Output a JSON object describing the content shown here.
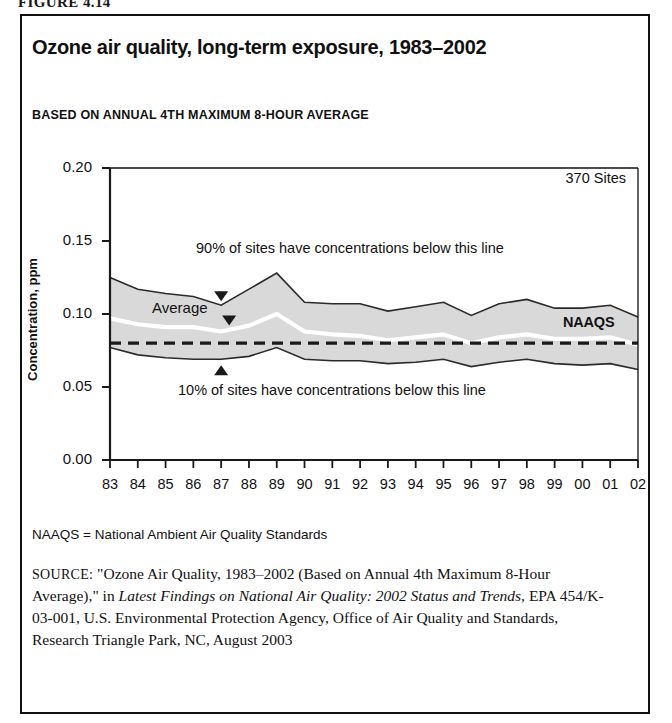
{
  "figure": {
    "tag": "FIGURE 4.14"
  },
  "header": {
    "title": "Ozone air quality, long-term exposure, 1983–2002",
    "subtitle": "BASED ON ANNUAL 4TH MAXIMUM 8-HOUR AVERAGE"
  },
  "footer": {
    "abbrev_note": "NAAQS = National Ambient Air Quality Standards",
    "source_kicker": "SOURCE:",
    "source_part1": " \"Ozone Air Quality, 1983–2002 (Based on Annual 4th Maximum 8-Hour Average),\" in ",
    "source_italic1": "Latest Findings on National Air Quality: 2002 Status and Trends,",
    "source_part2": " EPA 454/K-03-001, U.S. Environmental Protection Agency, Office of Air Quality and Standards, Research Triangle Park, NC, August 2003"
  },
  "colors": {
    "band_fill": "#d9d9d9",
    "band_edge": "#2b2b2b",
    "average_line": "#ffffff",
    "naaqs_line": "#1a1a1a",
    "axis": "#1a1a1a",
    "frame": "#111111"
  },
  "chart_data": {
    "type": "area",
    "title": "Ozone air quality, long-term exposure, 1983–2002",
    "subtitle": "BASED ON ANNUAL 4TH MAXIMUM 8-HOUR AVERAGE",
    "xlabel": "",
    "ylabel": "Concentration, ppm",
    "ylim": [
      0.0,
      0.2
    ],
    "yticks": [
      "0.00",
      "0.05",
      "0.10",
      "0.15",
      "0.20"
    ],
    "ytick_values": [
      0.0,
      0.05,
      0.1,
      0.15,
      0.2
    ],
    "grid": false,
    "legend_position": "inline-annotations",
    "x": [
      1983,
      1984,
      1985,
      1986,
      1987,
      1988,
      1989,
      1990,
      1991,
      1992,
      1993,
      1994,
      1995,
      1996,
      1997,
      1998,
      1999,
      2000,
      2001,
      2002
    ],
    "xtick_labels": [
      "83",
      "84",
      "85",
      "86",
      "87",
      "88",
      "89",
      "90",
      "91",
      "92",
      "93",
      "94",
      "95",
      "96",
      "97",
      "98",
      "99",
      "00",
      "01",
      "02"
    ],
    "series": [
      {
        "name": "90th percentile (90% of sites have concentrations below this line)",
        "style": "band-upper",
        "values": [
          0.125,
          0.117,
          0.114,
          0.112,
          0.106,
          0.117,
          0.128,
          0.108,
          0.107,
          0.107,
          0.102,
          0.105,
          0.108,
          0.099,
          0.107,
          0.11,
          0.104,
          0.104,
          0.106,
          0.098
        ]
      },
      {
        "name": "Average",
        "style": "white-line",
        "values": [
          0.097,
          0.093,
          0.091,
          0.091,
          0.088,
          0.092,
          0.1,
          0.088,
          0.086,
          0.085,
          0.082,
          0.084,
          0.086,
          0.08,
          0.084,
          0.086,
          0.083,
          0.083,
          0.084,
          0.079
        ]
      },
      {
        "name": "10th percentile (10% of sites have concentrations below this line)",
        "style": "band-lower",
        "values": [
          0.077,
          0.072,
          0.07,
          0.069,
          0.069,
          0.071,
          0.077,
          0.069,
          0.068,
          0.068,
          0.066,
          0.067,
          0.069,
          0.064,
          0.067,
          0.069,
          0.066,
          0.065,
          0.066,
          0.062
        ]
      }
    ],
    "reference_lines": [
      {
        "name": "NAAQS",
        "label": "NAAQS",
        "value": 0.08,
        "style": "dashed",
        "orientation": "horizontal"
      }
    ],
    "annotations": [
      {
        "id": "sites-count",
        "text": "370 Sites",
        "position": "top-right-inside"
      },
      {
        "id": "average",
        "text": "Average",
        "position": "on-white-line"
      },
      {
        "id": "upper-note",
        "text": "90% of sites have concentrations below this line",
        "position": "above-band",
        "arrow": "down"
      },
      {
        "id": "lower-note",
        "text": "10% of sites have concentrations below this line",
        "position": "below-band",
        "arrow": "up"
      },
      {
        "id": "naaqs",
        "text": "NAAQS",
        "position": "right-of-dashed-line"
      }
    ]
  }
}
